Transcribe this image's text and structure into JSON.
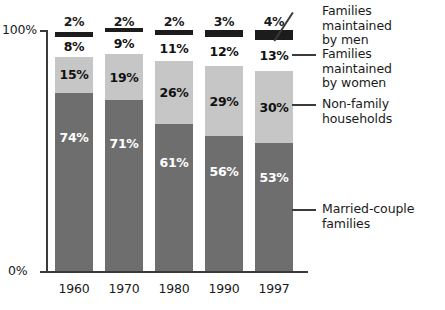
{
  "chart_data": {
    "type": "bar",
    "subtype": "stacked-100-percent",
    "title": "",
    "xlabel": "",
    "ylabel": "",
    "ylim": [
      0,
      100
    ],
    "grid": false,
    "legend_position": "right",
    "categories": [
      "1960",
      "1970",
      "1980",
      "1990",
      "1997"
    ],
    "y_ticks": [
      "0%",
      "100%"
    ],
    "series": [
      {
        "name": "Married-couple families",
        "color": "#6e6e6e",
        "label_color": "#ffffff",
        "values": [
          74,
          71,
          61,
          56,
          53
        ],
        "labels": [
          "74%",
          "71%",
          "61%",
          "56%",
          "53%"
        ]
      },
      {
        "name": "Non-family households",
        "color": "#c6c6c6",
        "label_color": "#111111",
        "values": [
          15,
          19,
          26,
          29,
          30
        ],
        "labels": [
          "15%",
          "19%",
          "26%",
          "29%",
          "30%"
        ]
      },
      {
        "name": "Families maintained by women",
        "color": "#ffffff",
        "label_color": "#111111",
        "values": [
          8,
          9,
          11,
          12,
          13
        ],
        "labels": [
          "8%",
          "9%",
          "11%",
          "12%",
          "13%"
        ]
      },
      {
        "name": "Families maintained by men",
        "color": "#1c1c1c",
        "label_color": "#1a1a1a",
        "values": [
          2,
          2,
          2,
          3,
          4
        ],
        "labels": [
          "2%",
          "2%",
          "2%",
          "3%",
          "4%"
        ],
        "labels_outside_above": true
      }
    ]
  },
  "axis": {
    "y_top_label": "100%",
    "y_bottom_label": "0%"
  },
  "x_labels": [
    "1960",
    "1970",
    "1980",
    "1990",
    "1997"
  ],
  "legend": {
    "items": [
      {
        "label": "Families maintained\nby men",
        "name": "legend-families-men"
      },
      {
        "label": "Families maintained\nby women",
        "name": "legend-families-women"
      },
      {
        "label": "Non-family\nhouseholds",
        "name": "legend-nonfamily"
      },
      {
        "label": "Married-couple\nfamilies",
        "name": "legend-married"
      }
    ]
  },
  "bar_labels": {
    "men": [
      "2%",
      "2%",
      "2%",
      "3%",
      "4%"
    ],
    "women": [
      "8%",
      "9%",
      "11%",
      "12%",
      "13%"
    ],
    "nonfamily": [
      "15%",
      "19%",
      "26%",
      "29%",
      "30%"
    ],
    "married": [
      "74%",
      "71%",
      "61%",
      "56%",
      "53%"
    ]
  }
}
